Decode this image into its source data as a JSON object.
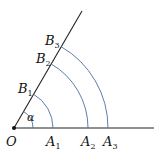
{
  "diagram": {
    "type": "geometry",
    "colors": {
      "lines": "#222222",
      "arcs": "#4a6fa5",
      "text": "#111111"
    },
    "origin": {
      "label": "O"
    },
    "angle": {
      "label": "α"
    },
    "points_on_base": [
      {
        "letter": "A",
        "sub": "1"
      },
      {
        "letter": "A",
        "sub": "2"
      },
      {
        "letter": "A",
        "sub": "3"
      }
    ],
    "points_on_ray": [
      {
        "letter": "B",
        "sub": "1"
      },
      {
        "letter": "B",
        "sub": "2"
      },
      {
        "letter": "B",
        "sub": "3"
      }
    ]
  }
}
